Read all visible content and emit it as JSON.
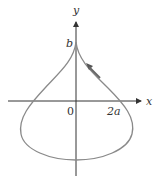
{
  "diagram": {
    "type": "parametric-curve",
    "axes": {
      "x_label": "x",
      "y_label": "y",
      "origin_label": "0",
      "x_tick_label": "2a",
      "y_tick_label": "b"
    },
    "colors": {
      "axis": "#333333",
      "curve": "#8a8a8a",
      "arrow": "#555555",
      "text": "#333333"
    },
    "curve_direction": "counterclockwise"
  }
}
